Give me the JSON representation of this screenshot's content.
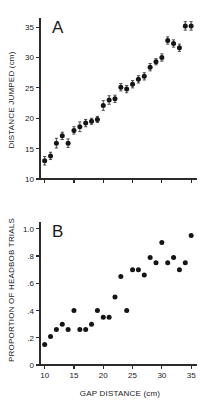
{
  "figure": {
    "background": "#ffffff",
    "point_color": "#151515",
    "axis_color": "#2b2b2b"
  },
  "panels": {
    "a": {
      "letter": "A",
      "ylabel": "DISTANCE JUMPED (cm)",
      "xlabel": ""
    },
    "b": {
      "letter": "B",
      "ylabel": "PROPORTION OF HEADBOB TRIALS",
      "xlabel": "GAP DISTANCE (cm)"
    }
  },
  "chart_data": [
    {
      "type": "scatter",
      "panel": "A",
      "title": "A",
      "xlabel": "",
      "ylabel": "DISTANCE JUMPED (cm)",
      "xlim": [
        9.2,
        36.0
      ],
      "ylim": [
        10,
        36.5
      ],
      "xticks": [
        10,
        15,
        20,
        25,
        30,
        35
      ],
      "xticklabels": [
        "",
        "",
        "",
        "",
        "",
        ""
      ],
      "yticks": [
        10,
        15,
        20,
        25,
        30,
        35
      ],
      "yticklabels": [
        "10",
        "15",
        "20",
        "25",
        "30",
        "35"
      ],
      "grid": false,
      "legend": false,
      "error_bars": "vertical",
      "x": [
        10.0,
        11.0,
        12.0,
        13.0,
        14.0,
        15.0,
        16.0,
        17.0,
        18.0,
        19.0,
        20.0,
        21.0,
        22.0,
        23.0,
        24.0,
        25.0,
        26.0,
        27.0,
        28.0,
        29.0,
        30.0,
        31.0,
        32.0,
        33.0,
        34.0,
        35.0
      ],
      "y": [
        13.0,
        13.8,
        15.9,
        17.1,
        15.9,
        18.0,
        18.6,
        19.2,
        19.5,
        19.8,
        22.1,
        23.0,
        23.2,
        25.1,
        24.8,
        25.6,
        26.4,
        26.9,
        28.4,
        29.3,
        30.0,
        32.8,
        32.3,
        31.6,
        35.2,
        35.2
      ],
      "yerr": [
        0.7,
        0.6,
        0.8,
        0.6,
        0.7,
        0.6,
        0.8,
        0.6,
        0.5,
        0.5,
        0.8,
        0.7,
        0.6,
        0.6,
        0.6,
        0.6,
        0.6,
        0.6,
        0.6,
        0.5,
        0.6,
        0.6,
        0.6,
        0.6,
        0.7,
        0.7
      ]
    },
    {
      "type": "scatter",
      "panel": "B",
      "title": "B",
      "xlabel": "GAP DISTANCE (cm)",
      "ylabel": "PROPORTION OF HEADBOB TRIALS",
      "xlim": [
        9.2,
        36.0
      ],
      "ylim": [
        0,
        1.05
      ],
      "xticks": [
        10,
        15,
        20,
        25,
        30,
        35
      ],
      "xticklabels": [
        "10",
        "15",
        "20",
        "25",
        "30",
        "35"
      ],
      "yticks": [
        0,
        0.2,
        0.4,
        0.6,
        0.8,
        1.0
      ],
      "yticklabels": [
        "0",
        ".2",
        ".4",
        ".6",
        ".8",
        "1.0"
      ],
      "grid": false,
      "legend": false,
      "error_bars": "none",
      "x": [
        10.0,
        11.0,
        12.0,
        13.0,
        14.0,
        15.0,
        16.0,
        17.0,
        18.0,
        19.0,
        20.0,
        21.0,
        22.0,
        23.0,
        24.0,
        25.0,
        26.0,
        27.0,
        28.0,
        29.0,
        30.0,
        31.0,
        32.0,
        33.0,
        34.0,
        35.0
      ],
      "y": [
        0.15,
        0.21,
        0.26,
        0.3,
        0.26,
        0.4,
        0.26,
        0.26,
        0.3,
        0.4,
        0.35,
        0.35,
        0.5,
        0.65,
        0.4,
        0.7,
        0.7,
        0.66,
        0.79,
        0.75,
        0.9,
        0.75,
        0.79,
        0.7,
        0.75,
        0.95
      ]
    }
  ]
}
